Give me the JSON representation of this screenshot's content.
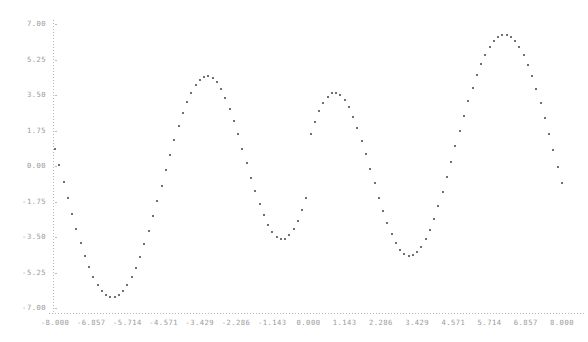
{
  "chart_data": {
    "type": "scatter",
    "title": "",
    "subtitle": "",
    "xlabel": "",
    "ylabel": "",
    "grid": false,
    "legend": null,
    "legend_position": "none",
    "marker": "small-square-dot",
    "marker_color": "#707070",
    "axis_color": "#b9b9b9",
    "axis_label_color": "#9a9a9a",
    "background": "#ffffff",
    "xlim": [
      -8.0,
      8.0
    ],
    "ylim": [
      -7.0,
      7.0
    ],
    "xticks": [
      -8.0,
      -6.857,
      -5.714,
      -4.571,
      -3.429,
      -2.286,
      -1.143,
      0.0,
      1.143,
      2.286,
      3.429,
      4.571,
      5.714,
      6.857,
      8.0
    ],
    "xtick_labels": [
      "-8.000",
      "-6.857",
      "-5.714",
      "-4.571",
      "-3.429",
      "-2.286",
      "-1.143",
      "0.000",
      "1.143",
      "2.286",
      "3.429",
      "4.571",
      "5.714",
      "6.857",
      "8.000"
    ],
    "yticks": [
      7.0,
      5.25,
      3.5,
      1.75,
      0.0,
      -1.75,
      -3.5,
      -5.25,
      -7.0
    ],
    "ytick_labels": [
      "7.00",
      "5.25",
      "3.50",
      "1.75",
      "0.00",
      "-1.75",
      "-3.50",
      "-5.25",
      "-7.00"
    ],
    "n_points": 120,
    "x": [
      -8.0,
      -7.866,
      -7.731,
      -7.597,
      -7.462,
      -7.328,
      -7.193,
      -7.059,
      -6.924,
      -6.79,
      -6.655,
      -6.521,
      -6.387,
      -6.252,
      -6.118,
      -5.983,
      -5.849,
      -5.714,
      -5.58,
      -5.445,
      -5.311,
      -5.176,
      -5.042,
      -4.908,
      -4.773,
      -4.639,
      -4.504,
      -4.37,
      -4.235,
      -4.101,
      -3.966,
      -3.832,
      -3.697,
      -3.563,
      -3.429,
      -3.294,
      -3.16,
      -3.025,
      -2.891,
      -2.756,
      -2.622,
      -2.487,
      -2.353,
      -2.218,
      -2.084,
      -1.95,
      -1.815,
      -1.681,
      -1.546,
      -1.412,
      -1.277,
      -1.143,
      -1.008,
      -0.874,
      -0.739,
      -0.605,
      -0.471,
      -0.336,
      -0.202,
      -0.067,
      0.067,
      0.202,
      0.336,
      0.471,
      0.605,
      0.739,
      0.874,
      1.008,
      1.143,
      1.277,
      1.412,
      1.546,
      1.681,
      1.815,
      1.95,
      2.084,
      2.218,
      2.353,
      2.487,
      2.622,
      2.756,
      2.891,
      3.025,
      3.16,
      3.294,
      3.429,
      3.563,
      3.697,
      3.832,
      3.966,
      4.101,
      4.235,
      4.37,
      4.504,
      4.639,
      4.773,
      4.908,
      5.042,
      5.176,
      5.311,
      5.445,
      5.58,
      5.714,
      5.849,
      5.983,
      6.118,
      6.252,
      6.387,
      6.521,
      6.655,
      6.79,
      6.924,
      7.059,
      7.193,
      7.328,
      7.462,
      7.597,
      7.731,
      7.866,
      8.0
    ],
    "y": [
      0.85,
      0.03,
      -0.79,
      -1.59,
      -2.37,
      -3.11,
      -3.8,
      -4.43,
      -4.99,
      -5.47,
      -5.87,
      -6.17,
      -6.38,
      -6.48,
      -6.48,
      -6.38,
      -6.18,
      -5.88,
      -5.49,
      -5.02,
      -4.47,
      -3.86,
      -3.19,
      -2.48,
      -1.74,
      -0.98,
      -0.22,
      0.54,
      1.27,
      1.96,
      2.59,
      3.15,
      3.62,
      3.99,
      4.25,
      4.4,
      4.43,
      4.33,
      4.12,
      3.79,
      3.36,
      2.83,
      2.23,
      1.56,
      0.86,
      0.14,
      -0.57,
      -1.25,
      -1.88,
      -2.44,
      -2.9,
      -3.26,
      -3.5,
      -3.61,
      -3.58,
      -3.42,
      -3.13,
      -2.71,
      -2.19,
      -1.58,
      1.58,
      2.19,
      2.71,
      3.13,
      3.42,
      3.58,
      3.61,
      3.5,
      3.26,
      2.9,
      2.44,
      1.88,
      1.25,
      0.57,
      -0.14,
      -0.86,
      -1.56,
      -2.23,
      -2.83,
      -3.36,
      -3.79,
      -4.12,
      -4.33,
      -4.43,
      -4.4,
      -4.25,
      -3.99,
      -3.62,
      -3.15,
      -2.59,
      -1.96,
      -1.27,
      -0.54,
      0.22,
      0.98,
      1.74,
      2.48,
      3.19,
      3.86,
      4.47,
      5.02,
      5.49,
      5.88,
      6.18,
      6.38,
      6.48,
      6.48,
      6.38,
      6.17,
      5.87,
      5.47,
      4.99,
      4.43,
      3.8,
      3.11,
      2.37,
      1.59,
      0.79,
      -0.03,
      -0.85
    ]
  },
  "geometry": {
    "plot_left": 55,
    "plot_right": 562,
    "plot_top": 24,
    "plot_bottom": 308,
    "axis_x": 53,
    "axis_y": 313
  }
}
